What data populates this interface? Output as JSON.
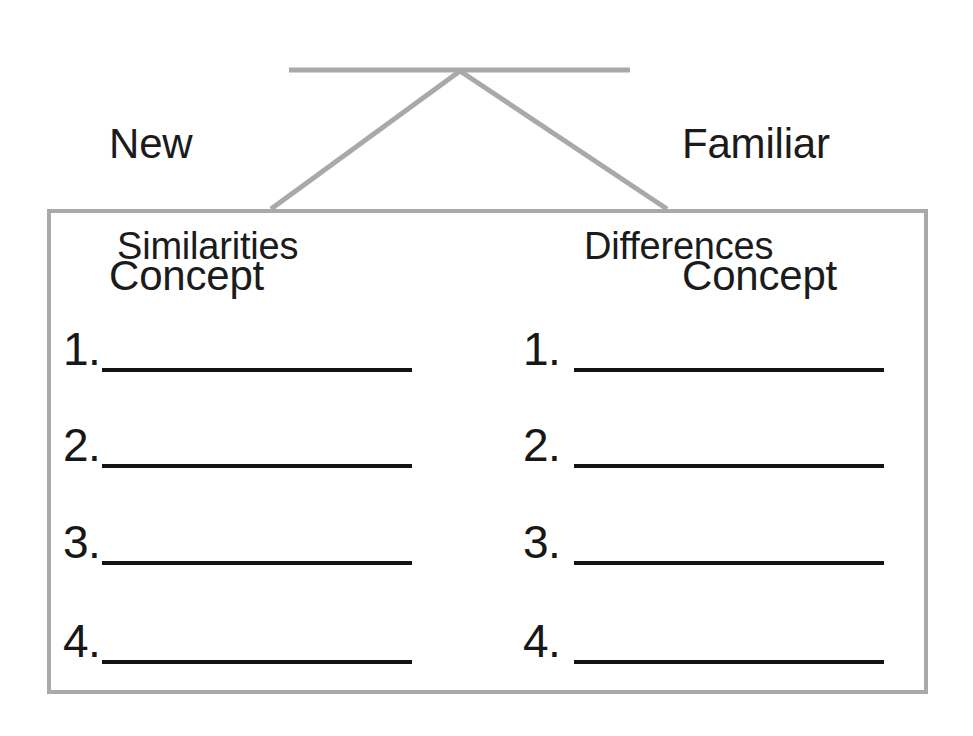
{
  "page": {
    "width": 973,
    "height": 736,
    "background_color": "#ffffff"
  },
  "colors": {
    "connector_gray": "#a9a9a9",
    "box_border_gray": "#a9a9a9",
    "text_black": "#1b1b1b",
    "blank_line_black": "#141414"
  },
  "top_labels": {
    "left": {
      "line_1": "New",
      "line_2": "Concept"
    },
    "right": {
      "line_1": "Familiar",
      "line_2": "Concept"
    }
  },
  "connector": {
    "description": "horizontal bar with inverted-V legs joining the two concept labels to the box",
    "bar": {
      "x1": 289,
      "y1": 70,
      "x2": 630,
      "y2": 70
    },
    "apex": {
      "x": 460,
      "y": 71
    },
    "leg_left_end": {
      "x": 271,
      "y": 209
    },
    "leg_right_end": {
      "x": 667,
      "y": 209
    },
    "stroke_width": 5
  },
  "box": {
    "x": 47,
    "y": 209,
    "width": 881,
    "height": 485,
    "border_width": 4
  },
  "columns": [
    {
      "id": "similarities",
      "header": "Similarities",
      "rows": [
        {
          "number": "1.",
          "value": ""
        },
        {
          "number": "2.",
          "value": ""
        },
        {
          "number": "3.",
          "value": ""
        },
        {
          "number": "4.",
          "value": ""
        }
      ]
    },
    {
      "id": "differences",
      "header": "Differences",
      "rows": [
        {
          "number": "1.",
          "value": ""
        },
        {
          "number": "2.",
          "value": ""
        },
        {
          "number": "3.",
          "value": ""
        },
        {
          "number": "4.",
          "value": ""
        }
      ]
    }
  ]
}
